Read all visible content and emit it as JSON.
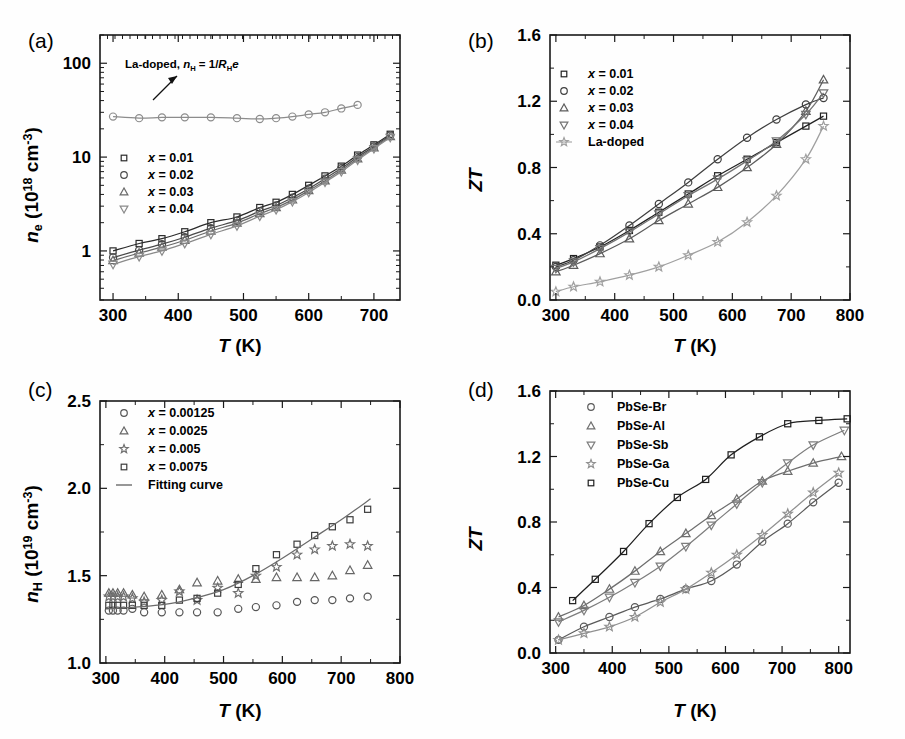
{
  "figure": {
    "background": "#fefefe",
    "panels": [
      "a",
      "b",
      "c",
      "d"
    ]
  },
  "panel_a": {
    "label": "(a)",
    "annotation": "La-doped, nH = 1/RHe",
    "legend_title": "(AgxPbTe)0.945(Ag2Te)0.055",
    "legend": [
      "x = 0.01",
      "x = 0.02",
      "x = 0.03",
      "x = 0.04"
    ],
    "chart_data": {
      "type": "line",
      "title": "",
      "xlabel": "T (K)",
      "ylabel": "n_e (10^18 cm^-3)",
      "xlim": [
        280,
        740
      ],
      "ylim": [
        0.3,
        200
      ],
      "yscale": "log",
      "xticks": [
        300,
        400,
        500,
        600,
        700
      ],
      "yticks": [
        1,
        10,
        100
      ],
      "grid": false,
      "legend_position": "inner-left",
      "series": [
        {
          "name": "La-doped",
          "marker": "circle",
          "color": "#8c8c8c",
          "x": [
            300,
            340,
            375,
            410,
            450,
            490,
            525,
            550,
            575,
            600,
            625,
            650,
            675
          ],
          "y": [
            27,
            26,
            26.5,
            26.5,
            26.5,
            26,
            25.5,
            26,
            27,
            28.5,
            30,
            33,
            36
          ]
        },
        {
          "name": "x = 0.01",
          "marker": "square",
          "color": "#2b2b2b",
          "x": [
            300,
            340,
            375,
            410,
            450,
            490,
            525,
            550,
            575,
            600,
            625,
            650,
            675,
            700,
            725
          ],
          "y": [
            1.0,
            1.2,
            1.35,
            1.6,
            2.0,
            2.3,
            2.9,
            3.3,
            4.0,
            5.0,
            6.3,
            8.0,
            10.5,
            13.5,
            17.5
          ]
        },
        {
          "name": "x = 0.02",
          "marker": "circle",
          "color": "#4a4a4a",
          "x": [
            300,
            340,
            375,
            410,
            450,
            490,
            525,
            550,
            575,
            600,
            625,
            650,
            675,
            700,
            725
          ],
          "y": [
            0.85,
            1.02,
            1.18,
            1.4,
            1.75,
            2.1,
            2.65,
            3.05,
            3.7,
            4.6,
            5.9,
            7.6,
            10.0,
            13.0,
            17.0
          ]
        },
        {
          "name": "x = 0.03",
          "marker": "triangle-up",
          "color": "#6a6a6a",
          "x": [
            300,
            340,
            375,
            410,
            450,
            490,
            525,
            550,
            575,
            600,
            625,
            650,
            675,
            700,
            725
          ],
          "y": [
            0.79,
            0.95,
            1.1,
            1.3,
            1.63,
            1.98,
            2.5,
            2.9,
            3.5,
            4.4,
            5.6,
            7.3,
            9.6,
            12.6,
            16.6
          ]
        },
        {
          "name": "x = 0.04",
          "marker": "triangle-down",
          "color": "#8a8a8a",
          "x": [
            300,
            340,
            375,
            410,
            450,
            490,
            525,
            550,
            575,
            600,
            625,
            650,
            675,
            700,
            725
          ],
          "y": [
            0.72,
            0.87,
            1.0,
            1.2,
            1.5,
            1.85,
            2.35,
            2.75,
            3.35,
            4.2,
            5.4,
            7.0,
            9.3,
            12.3,
            16.2
          ]
        }
      ]
    }
  },
  "panel_b": {
    "label": "(b)",
    "legend_title": "(AgxPbTe)0.945(Ag2Te)0.055",
    "legend": [
      "x = 0.01",
      "x = 0.02",
      "x = 0.03",
      "x = 0.04",
      "La-doped"
    ],
    "chart_data": {
      "type": "line",
      "title": "",
      "xlabel": "T (K)",
      "ylabel": "ZT",
      "xlim": [
        290,
        800
      ],
      "ylim": [
        0.0,
        1.6
      ],
      "yscale": "linear",
      "xticks": [
        300,
        400,
        500,
        600,
        700,
        800
      ],
      "yticks": [
        0.0,
        0.4,
        0.8,
        1.2,
        1.6
      ],
      "grid": false,
      "legend_position": "inner-left",
      "series": [
        {
          "name": "x = 0.01",
          "marker": "square",
          "color": "#222222",
          "x": [
            300,
            330,
            375,
            425,
            475,
            525,
            575,
            625,
            675,
            725,
            755
          ],
          "y": [
            0.21,
            0.25,
            0.32,
            0.42,
            0.53,
            0.64,
            0.75,
            0.85,
            0.95,
            1.05,
            1.11
          ]
        },
        {
          "name": "x = 0.02",
          "marker": "circle",
          "color": "#3f3f3f",
          "x": [
            300,
            330,
            375,
            425,
            475,
            525,
            575,
            625,
            675,
            725,
            755
          ],
          "y": [
            0.2,
            0.24,
            0.33,
            0.45,
            0.58,
            0.71,
            0.85,
            0.98,
            1.09,
            1.18,
            1.22
          ]
        },
        {
          "name": "x = 0.03",
          "marker": "triangle-up",
          "color": "#5c5c5c",
          "x": [
            300,
            330,
            375,
            425,
            475,
            525,
            575,
            625,
            675,
            725,
            755
          ],
          "y": [
            0.17,
            0.21,
            0.28,
            0.37,
            0.48,
            0.58,
            0.68,
            0.8,
            0.94,
            1.14,
            1.33
          ]
        },
        {
          "name": "x = 0.04",
          "marker": "triangle-down",
          "color": "#737373",
          "x": [
            300,
            330,
            375,
            425,
            475,
            525,
            575,
            625,
            675,
            725,
            755
          ],
          "y": [
            0.19,
            0.23,
            0.31,
            0.41,
            0.52,
            0.63,
            0.73,
            0.84,
            0.96,
            1.12,
            1.25
          ]
        },
        {
          "name": "La-doped",
          "marker": "star",
          "color": "#a0a0a0",
          "x": [
            300,
            330,
            375,
            425,
            475,
            525,
            575,
            625,
            675,
            725,
            755
          ],
          "y": [
            0.05,
            0.08,
            0.11,
            0.15,
            0.2,
            0.27,
            0.35,
            0.47,
            0.63,
            0.85,
            1.05
          ]
        }
      ]
    }
  },
  "panel_c": {
    "label": "(c)",
    "legend_title": "PbCuxSe",
    "legend": [
      "x = 0.00125",
      "x = 0.0025",
      "x = 0.005",
      "x = 0.0075",
      "Fitting curve"
    ],
    "chart_data": {
      "type": "scatter",
      "title": "",
      "xlabel": "T (K)",
      "ylabel": "n_H (10^19 cm^-3)",
      "xlim": [
        290,
        800
      ],
      "ylim": [
        1.0,
        2.5
      ],
      "yscale": "linear",
      "xticks": [
        300,
        400,
        500,
        600,
        700,
        800
      ],
      "yticks": [
        1.0,
        1.5,
        2.0,
        2.5
      ],
      "grid": false,
      "legend_position": "inner-left",
      "series": [
        {
          "name": "x = 0.00125",
          "marker": "circle",
          "color": "#555555",
          "x": [
            305,
            312,
            320,
            330,
            345,
            365,
            395,
            425,
            455,
            490,
            525,
            555,
            590,
            625,
            655,
            685,
            715,
            745
          ],
          "y": [
            1.3,
            1.3,
            1.3,
            1.3,
            1.31,
            1.29,
            1.29,
            1.29,
            1.29,
            1.29,
            1.31,
            1.32,
            1.33,
            1.35,
            1.36,
            1.36,
            1.37,
            1.38
          ]
        },
        {
          "name": "x = 0.0025",
          "marker": "triangle-up",
          "color": "#666666",
          "x": [
            305,
            312,
            320,
            330,
            345,
            365,
            395,
            425,
            455,
            490,
            525,
            555,
            590,
            625,
            655,
            685,
            715,
            745
          ],
          "y": [
            1.4,
            1.4,
            1.4,
            1.4,
            1.39,
            1.38,
            1.39,
            1.42,
            1.46,
            1.47,
            1.48,
            1.48,
            1.49,
            1.49,
            1.49,
            1.5,
            1.53,
            1.56
          ]
        },
        {
          "name": "x = 0.005",
          "marker": "star",
          "color": "#707070",
          "x": [
            305,
            312,
            320,
            330,
            345,
            365,
            395,
            425,
            455,
            490,
            525,
            555,
            590,
            625,
            655,
            685,
            715,
            745
          ],
          "y": [
            1.38,
            1.38,
            1.38,
            1.38,
            1.37,
            1.35,
            1.36,
            1.41,
            1.36,
            1.43,
            1.4,
            1.5,
            1.55,
            1.62,
            1.65,
            1.67,
            1.68,
            1.67
          ]
        },
        {
          "name": "x = 0.0075",
          "marker": "square",
          "color": "#3d3d3d",
          "x": [
            305,
            312,
            320,
            330,
            345,
            365,
            395,
            425,
            455,
            490,
            525,
            555,
            590,
            625,
            655,
            685,
            715,
            745
          ],
          "y": [
            1.33,
            1.33,
            1.33,
            1.33,
            1.33,
            1.33,
            1.33,
            1.36,
            1.37,
            1.4,
            1.45,
            1.54,
            1.62,
            1.68,
            1.73,
            1.78,
            1.82,
            1.88
          ]
        },
        {
          "name": "Fitting curve",
          "marker": "none",
          "color": "#6b6b6b",
          "x": [
            300,
            350,
            400,
            450,
            500,
            550,
            600,
            650,
            700,
            750
          ],
          "y": [
            1.31,
            1.32,
            1.335,
            1.37,
            1.42,
            1.5,
            1.6,
            1.71,
            1.82,
            1.94
          ]
        }
      ]
    }
  },
  "panel_d": {
    "label": "(d)",
    "legend": [
      "PbSe-Br",
      "PbSe-Al",
      "PbSe-Sb",
      "PbSe-Ga",
      "PbSe-Cu"
    ],
    "chart_data": {
      "type": "line",
      "title": "",
      "xlabel": "T (K)",
      "ylabel": "ZT",
      "xlim": [
        290,
        820
      ],
      "ylim": [
        0.0,
        1.6
      ],
      "yscale": "linear",
      "xticks": [
        300,
        400,
        500,
        600,
        700,
        800
      ],
      "yticks": [
        0.0,
        0.4,
        0.8,
        1.2,
        1.6
      ],
      "grid": false,
      "legend_position": "inner-left",
      "series": [
        {
          "name": "PbSe-Br",
          "marker": "circle",
          "color": "#5a5a5a",
          "x": [
            305,
            350,
            395,
            440,
            485,
            530,
            575,
            620,
            665,
            710,
            755,
            800
          ],
          "y": [
            0.08,
            0.16,
            0.22,
            0.28,
            0.33,
            0.39,
            0.44,
            0.54,
            0.68,
            0.79,
            0.92,
            1.04
          ]
        },
        {
          "name": "PbSe-Al",
          "marker": "triangle-up",
          "color": "#6e6e6e",
          "x": [
            305,
            350,
            395,
            440,
            485,
            530,
            575,
            620,
            665,
            710,
            755,
            805
          ],
          "y": [
            0.22,
            0.29,
            0.39,
            0.5,
            0.62,
            0.73,
            0.84,
            0.94,
            1.05,
            1.11,
            1.16,
            1.2
          ]
        },
        {
          "name": "PbSe-Sb",
          "marker": "triangle-down",
          "color": "#7d7d7d",
          "x": [
            305,
            350,
            395,
            440,
            485,
            530,
            575,
            620,
            665,
            710,
            755,
            810
          ],
          "y": [
            0.19,
            0.26,
            0.34,
            0.43,
            0.53,
            0.65,
            0.78,
            0.91,
            1.04,
            1.16,
            1.27,
            1.36
          ]
        },
        {
          "name": "PbSe-Ga",
          "marker": "star",
          "color": "#909090",
          "x": [
            305,
            350,
            395,
            440,
            485,
            530,
            575,
            620,
            665,
            710,
            755,
            800
          ],
          "y": [
            0.08,
            0.12,
            0.16,
            0.22,
            0.31,
            0.39,
            0.49,
            0.6,
            0.72,
            0.85,
            0.98,
            1.1
          ]
        },
        {
          "name": "PbSe-Cu",
          "marker": "square",
          "color": "#1f1f1f",
          "x": [
            330,
            370,
            420,
            465,
            515,
            565,
            610,
            660,
            710,
            765,
            815
          ],
          "y": [
            0.32,
            0.45,
            0.62,
            0.79,
            0.95,
            1.06,
            1.21,
            1.32,
            1.4,
            1.42,
            1.43
          ]
        }
      ]
    }
  }
}
